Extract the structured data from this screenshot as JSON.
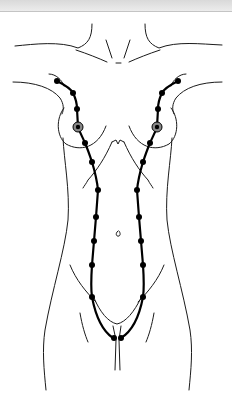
{
  "colors": {
    "background": "#ffffff",
    "line": "#000000",
    "outline": "#1a1a1a",
    "topbar": "#e0e0e0"
  },
  "milk_lines": {
    "left": {
      "points": [
        [
          57,
          81
        ],
        [
          73,
          93
        ],
        [
          77,
          109
        ],
        [
          78,
          127
        ],
        [
          85,
          143
        ],
        [
          92,
          162
        ],
        [
          98,
          190
        ],
        [
          96,
          217
        ],
        [
          94,
          241
        ],
        [
          92,
          265
        ],
        [
          92,
          297
        ],
        [
          113,
          338
        ]
      ],
      "nipple": [
        78,
        127
      ]
    },
    "right": {
      "points": [
        [
          178,
          81
        ],
        [
          162,
          93
        ],
        [
          158,
          109
        ],
        [
          157,
          127
        ],
        [
          150,
          143
        ],
        [
          143,
          162
        ],
        [
          137,
          190
        ],
        [
          139,
          217
        ],
        [
          141,
          241
        ],
        [
          143,
          265
        ],
        [
          143,
          297
        ],
        [
          121,
          338
        ]
      ],
      "nipple": [
        157,
        127
      ]
    }
  }
}
